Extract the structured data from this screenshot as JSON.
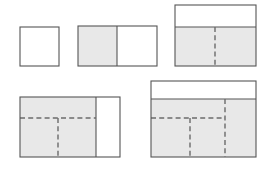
{
  "diagram": {
    "background_color": "#ffffff",
    "shade_color": "#e8e8e8",
    "unshaded_color": "#ffffff",
    "solid_stroke_color": "#555555",
    "dashed_stroke_color": "#6b6b6b",
    "figure_count": 5,
    "figures": [
      {
        "id": "figure-1",
        "name": "empty-square",
        "x": 20,
        "y": 27,
        "width": 39,
        "height": 39,
        "shaded_fraction": "0",
        "shaded_regions": [],
        "solid_dividers": [],
        "dashed_dividers": []
      },
      {
        "id": "figure-2",
        "name": "halved-rectangle",
        "x": 78,
        "y": 26,
        "width": 79,
        "height": 40,
        "shaded_fraction": "1/2",
        "shaded_regions": [
          {
            "x": 78,
            "y": 26,
            "width": 39,
            "height": 40
          }
        ],
        "solid_dividers": [
          {
            "orientation": "vertical",
            "x": 117,
            "y1": 26,
            "y2": 66
          }
        ],
        "dashed_dividers": []
      },
      {
        "id": "figure-3",
        "name": "banded-rectangle-with-center-dash",
        "x": 175,
        "y": 5,
        "width": 81,
        "height": 61,
        "shaded_fraction": "2/3",
        "shaded_regions": [
          {
            "x": 175,
            "y": 27,
            "width": 81,
            "height": 39
          }
        ],
        "solid_dividers": [
          {
            "orientation": "horizontal",
            "y": 27,
            "x1": 175,
            "x2": 256
          }
        ],
        "dashed_dividers": [
          {
            "orientation": "vertical",
            "x": 215,
            "y1": 27,
            "y2": 66
          }
        ]
      },
      {
        "id": "figure-4",
        "name": "left-shaded-rectangle-with-tee-dash",
        "x": 20,
        "y": 97,
        "width": 100,
        "height": 60,
        "shaded_fraction": "3/4",
        "shaded_regions": [
          {
            "x": 20,
            "y": 97,
            "width": 76,
            "height": 60
          }
        ],
        "solid_dividers": [
          {
            "orientation": "vertical",
            "x": 96,
            "y1": 97,
            "y2": 157
          }
        ],
        "dashed_dividers": [
          {
            "orientation": "horizontal",
            "y": 118,
            "x1": 20,
            "x2": 96
          },
          {
            "orientation": "vertical",
            "x": 58,
            "y1": 118,
            "y2": 157
          }
        ]
      },
      {
        "id": "figure-5",
        "name": "banded-rectangle-with-double-dash",
        "x": 151,
        "y": 81,
        "width": 105,
        "height": 76,
        "shaded_fraction": "4/5",
        "shaded_regions": [
          {
            "x": 151,
            "y": 99,
            "width": 105,
            "height": 58
          }
        ],
        "solid_dividers": [
          {
            "orientation": "horizontal",
            "y": 99,
            "x1": 151,
            "x2": 256
          }
        ],
        "dashed_dividers": [
          {
            "orientation": "horizontal",
            "y": 118,
            "x1": 151,
            "x2": 225
          },
          {
            "orientation": "vertical",
            "x": 190,
            "y1": 118,
            "y2": 157
          },
          {
            "orientation": "vertical",
            "x": 225,
            "y1": 99,
            "y2": 157
          }
        ]
      }
    ]
  }
}
